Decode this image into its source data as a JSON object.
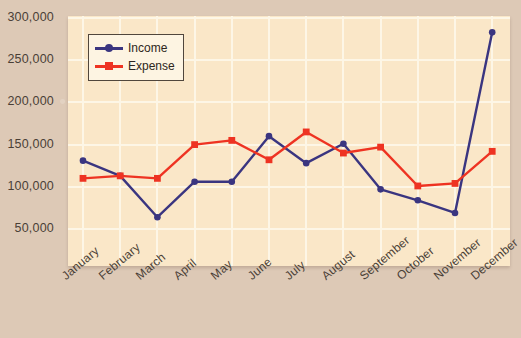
{
  "chart_data": {
    "type": "line",
    "title": "",
    "xlabel": "",
    "ylabel": "",
    "categories": [
      "January",
      "February",
      "March",
      "April",
      "May",
      "June",
      "July",
      "August",
      "September",
      "October",
      "November",
      "December"
    ],
    "series": [
      {
        "name": "Income",
        "color": "#3a3580",
        "marker": "circle",
        "values": [
          131000,
          113000,
          64000,
          106000,
          106000,
          160000,
          128000,
          151000,
          97000,
          84000,
          69000,
          283000
        ]
      },
      {
        "name": "Expense",
        "color": "#ee3322",
        "marker": "square",
        "values": [
          110000,
          113000,
          110000,
          150000,
          155000,
          132000,
          165000,
          140000,
          147000,
          101000,
          104000,
          142000
        ]
      }
    ],
    "yticks": [
      50000,
      100000,
      150000,
      200000,
      250000,
      300000
    ],
    "ytick_labels": [
      "50,000",
      "100,000",
      "150,000",
      "200,000",
      "250,000",
      "300,000"
    ],
    "ylim": [
      0,
      310000
    ],
    "grid": true,
    "legend_position": "top-left",
    "plot_background": "#fae7c8",
    "page_background": "#ddc9b6",
    "gridline_color": "#fdf6e6"
  },
  "legend": {
    "items": [
      {
        "label": "Income"
      },
      {
        "label": "Expense"
      }
    ]
  }
}
